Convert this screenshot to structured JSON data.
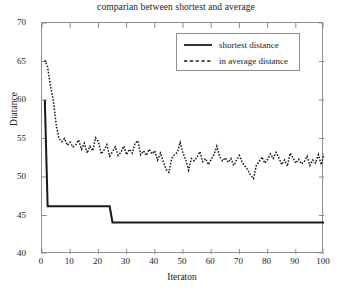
{
  "chart_data": {
    "type": "line",
    "title": "comparian between shortest and average",
    "xlabel": "Iteraton",
    "ylabel": "Diatance",
    "xlim": [
      0,
      100
    ],
    "ylim": [
      40,
      70
    ],
    "xticks": [
      0,
      10,
      20,
      30,
      40,
      50,
      60,
      70,
      80,
      90,
      100
    ],
    "yticks": [
      40,
      45,
      50,
      55,
      60,
      65,
      70
    ],
    "grid": false,
    "legend_position": "top-right-inside",
    "series": [
      {
        "name": "shortest distance",
        "style": "solid",
        "color": "#1a1a1a",
        "x": [
          1,
          2,
          3,
          24,
          25,
          100
        ],
        "values": [
          60.0,
          46.2,
          46.2,
          46.2,
          44.1,
          44.1
        ]
      },
      {
        "name": "in average distance",
        "style": "dashed",
        "color": "#1a1a1a",
        "x": [
          1,
          2,
          3,
          4,
          5,
          6,
          7,
          8,
          9,
          10,
          11,
          12,
          13,
          14,
          15,
          16,
          17,
          18,
          19,
          20,
          21,
          22,
          23,
          24,
          25,
          26,
          27,
          28,
          29,
          30,
          31,
          32,
          33,
          34,
          35,
          36,
          37,
          38,
          39,
          40,
          41,
          42,
          43,
          44,
          45,
          46,
          47,
          48,
          49,
          50,
          51,
          52,
          53,
          54,
          55,
          56,
          57,
          58,
          59,
          60,
          61,
          62,
          63,
          64,
          65,
          66,
          67,
          68,
          69,
          70,
          71,
          72,
          73,
          74,
          75,
          76,
          77,
          78,
          79,
          80,
          81,
          82,
          83,
          84,
          85,
          86,
          87,
          88,
          89,
          90,
          91,
          92,
          93,
          94,
          95,
          96,
          97,
          98,
          99,
          100
        ],
        "values": [
          65.2,
          64.3,
          61.8,
          60.0,
          56.9,
          55.0,
          54.6,
          55.0,
          54.1,
          54.5,
          53.9,
          54.2,
          54.8,
          53.6,
          54.4,
          53.1,
          54.0,
          53.4,
          55.1,
          54.6,
          53.0,
          53.5,
          54.2,
          52.7,
          53.3,
          53.9,
          52.8,
          53.2,
          54.0,
          52.9,
          53.6,
          53.1,
          54.4,
          54.7,
          52.9,
          53.4,
          52.8,
          53.6,
          53.0,
          53.4,
          52.2,
          53.1,
          52.0,
          51.0,
          50.6,
          52.4,
          52.9,
          53.2,
          54.5,
          53.1,
          52.2,
          50.9,
          52.4,
          52.1,
          52.6,
          53.3,
          52.0,
          52.4,
          51.6,
          52.3,
          52.9,
          54.0,
          52.6,
          52.1,
          52.5,
          51.9,
          52.4,
          51.5,
          52.2,
          52.8,
          51.9,
          51.4,
          50.9,
          50.2,
          49.8,
          51.5,
          52.0,
          52.6,
          51.8,
          52.3,
          53.0,
          52.4,
          53.2,
          52.5,
          51.6,
          52.2,
          51.4,
          53.1,
          52.5,
          51.8,
          52.3,
          51.7,
          52.0,
          52.7,
          51.5,
          52.2,
          51.8,
          52.9,
          51.6,
          53.0
        ]
      }
    ]
  },
  "legend": {
    "items": [
      {
        "label": "shortest distance",
        "style": "solid"
      },
      {
        "label": "in average distance",
        "style": "dashed"
      }
    ]
  }
}
